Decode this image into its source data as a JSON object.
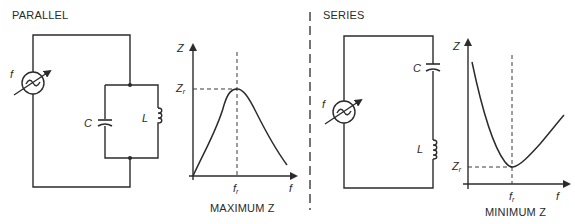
{
  "parallel": {
    "title": "PARALLEL",
    "source_label": "f",
    "capacitor_label": "C",
    "inductor_label": "L",
    "graph": {
      "y_axis_label": "Z",
      "x_axis_label": "f",
      "peak_y_label": "Z",
      "peak_y_sub": "r",
      "peak_x_label": "f",
      "peak_x_sub": "r",
      "caption": "MAXIMUM Z"
    }
  },
  "series": {
    "title": "SERIES",
    "source_label": "f",
    "capacitor_label": "C",
    "inductor_label": "L",
    "graph": {
      "y_axis_label": "Z",
      "x_axis_label": "f",
      "min_y_label": "Z",
      "min_y_sub": "r",
      "min_x_label": "f",
      "min_x_sub": "r",
      "caption": "MINIMUM Z"
    }
  },
  "colors": {
    "line": "#2b2b2b",
    "background": "#ffffff"
  }
}
